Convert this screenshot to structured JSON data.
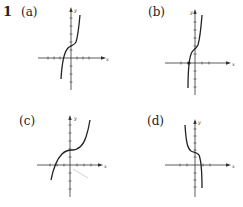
{
  "problem": {
    "number": "1"
  },
  "panels": [
    {
      "id": "a",
      "label": "(a)",
      "x_axis_label": "x",
      "y_axis_label": "y",
      "description": "increasing cubic, inflection above origin, x-intercept left of origin"
    },
    {
      "id": "b",
      "label": "(b)",
      "x_axis_label": "x",
      "y_axis_label": "y",
      "description": "steep increasing cubic, inflection above origin, x-intercept marked by dot left of origin"
    },
    {
      "id": "c",
      "label": "(c)",
      "x_axis_label": "x",
      "y_axis_label": "y",
      "description": "wider increasing cubic, inflection on y-axis above origin, x-intercept further left"
    },
    {
      "id": "d",
      "label": "(d)",
      "x_axis_label": "x",
      "y_axis_label": "y",
      "description": "decreasing cubic, inflection on y-axis above origin, x-intercept right of origin"
    }
  ],
  "colors": {
    "curve": "#222222",
    "axis": "#333333",
    "background": "#ffffff"
  }
}
